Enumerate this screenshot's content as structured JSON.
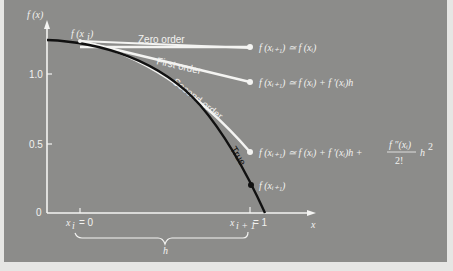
{
  "figure": {
    "y_axis_label": "f (x)",
    "x_axis_label": "x",
    "y_ticks": [
      "1.0",
      "0.5",
      "0"
    ],
    "x_ticks": {
      "xi": "x",
      "xi_sub": "i",
      "xi_value": "= 0",
      "xi1": "x",
      "xi1_sub": "i + 1",
      "xi1_value": "= 1"
    },
    "brace_label": "h",
    "start_point_label": "f (x",
    "start_point_sub": "i",
    "start_point_close": ")",
    "curves": [
      {
        "name": "Zero order",
        "label": "Zero order"
      },
      {
        "name": "First order",
        "label": "First order"
      },
      {
        "name": "Second order",
        "label": "Second order"
      },
      {
        "name": "True",
        "label": "True"
      }
    ],
    "equations": {
      "zero": "f (xᵢ₊₁) ≃ f (xᵢ)",
      "first": "f (xᵢ₊₁) ≃ f (xᵢ) + f ′(xᵢ)h",
      "second_lhs": "f (xᵢ₊₁) ≃ f (xᵢ) + f ′(xᵢ)h +",
      "second_num": "f ″(xᵢ)",
      "second_den": "2!",
      "second_tail": "h",
      "second_exp": "2",
      "true_point": "f (xᵢ₊₁)"
    },
    "colors": {
      "background": "#8c8c8a",
      "approximations": "#f4f4f2",
      "true_curve": "#111111",
      "axes": "#f4f4f2"
    }
  }
}
